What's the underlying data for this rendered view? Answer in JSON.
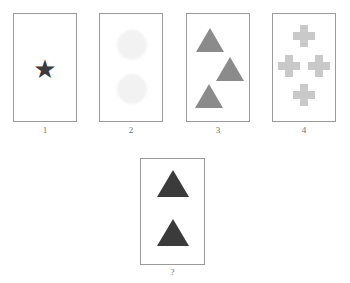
{
  "puzzle": {
    "type": "visual-analogy-matrix",
    "background_color": "#ffffff",
    "card_border_color": "#9a9a9a",
    "label_color": "#707070",
    "options": [
      {
        "label": "1",
        "shape_name": "star",
        "shape_count": 1,
        "shape_color": "#3b3b3b",
        "shape_glyph": "★",
        "arrangement": "single-centered"
      },
      {
        "label": "2",
        "shape_name": "faint-circle",
        "shape_count": 2,
        "shape_color": "#f2f2f2",
        "shape_glyph": "",
        "arrangement": "vertical-pair"
      },
      {
        "label": "3",
        "shape_name": "triangle",
        "shape_count": 3,
        "shape_color": "#8b8b8b",
        "shape_glyph": "▲",
        "arrangement": "zigzag-column"
      },
      {
        "label": "4",
        "shape_name": "cross",
        "shape_count": 4,
        "shape_color": "#c9c9c9",
        "shape_glyph": "✚",
        "arrangement": "diamond"
      }
    ],
    "answer_card": {
      "label": "?",
      "shape_name": "triangle",
      "shape_count": 2,
      "shape_color": "#3b3b3b",
      "shape_glyph": "▲",
      "arrangement": "vertical-pair"
    }
  }
}
